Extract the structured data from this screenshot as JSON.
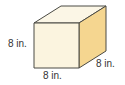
{
  "figure": {
    "shape": "cube",
    "labels": {
      "height": "8 in.",
      "width": "8 in.",
      "depth": "8 in."
    },
    "colors": {
      "front": "#fbf4df",
      "top": "#fbf6e6",
      "side": "#f5d690",
      "edge": "#4a4a44"
    }
  }
}
